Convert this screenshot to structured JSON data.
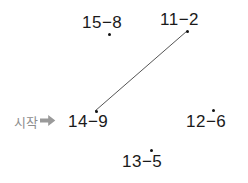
{
  "canvas": {
    "width": 248,
    "height": 183,
    "background": "#ffffff"
  },
  "colors": {
    "text": "#1a1a1a",
    "dot": "#111111",
    "line": "#555555",
    "start_text": "#8d8d8d",
    "start_arrow": "#9a9a9a"
  },
  "start_marker": {
    "label": "시작",
    "arrow_glyph": "➜",
    "arrow_name": "right-arrow-icon",
    "x": 14,
    "y": 114,
    "points_to": "14-9"
  },
  "nodes": [
    {
      "id": "15-8",
      "label": "15−8",
      "left": "15",
      "right": "8",
      "separator": "−",
      "x": 82,
      "y": 14,
      "dot": {
        "x": 108,
        "y": 33,
        "position": "below"
      }
    },
    {
      "id": "11-2",
      "label": "11−2",
      "left": "11",
      "right": "2",
      "separator": "−",
      "x": 160,
      "y": 11,
      "dot": {
        "x": 186,
        "y": 30,
        "position": "below"
      }
    },
    {
      "id": "14-9",
      "label": "14−9",
      "left": "14",
      "right": "9",
      "separator": "−",
      "x": 68,
      "y": 113,
      "dot": {
        "x": 95,
        "y": 110,
        "position": "above"
      }
    },
    {
      "id": "12-6",
      "label": "12−6",
      "left": "12",
      "right": "6",
      "separator": "−",
      "x": 186,
      "y": 113,
      "dot": {
        "x": 212,
        "y": 109,
        "position": "above"
      }
    },
    {
      "id": "13-5",
      "label": "13−5",
      "left": "13",
      "right": "5",
      "separator": "−",
      "x": 122,
      "y": 153,
      "dot": {
        "x": 150,
        "y": 149,
        "position": "above"
      }
    }
  ],
  "connections": [
    {
      "id": "14-9__11-2",
      "from": "14-9",
      "to": "11-2",
      "x1": 95,
      "y1": 111,
      "x2": 187,
      "y2": 31,
      "color": "#555555",
      "width": 1
    }
  ]
}
